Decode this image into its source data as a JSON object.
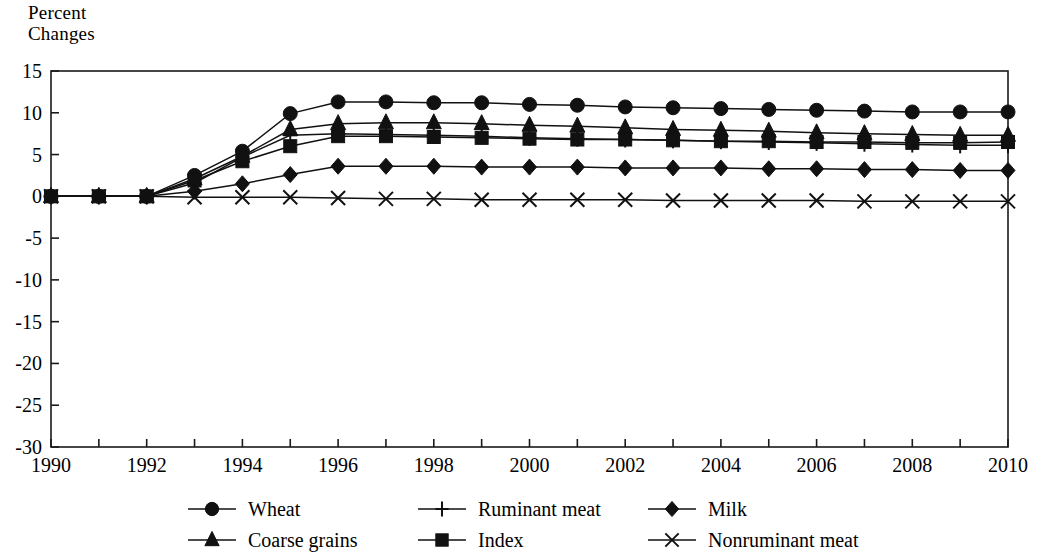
{
  "chart_data": {
    "type": "line",
    "title": "",
    "ylabel": "Percent\nChanges",
    "xlabel": "",
    "xlim": [
      1990,
      2010
    ],
    "ylim": [
      -30,
      15
    ],
    "yticks": [
      15,
      10,
      5,
      0,
      -5,
      -10,
      -15,
      -20,
      -25,
      -30
    ],
    "ytick_labels": [
      "15",
      "10",
      "5",
      "0",
      "-5",
      "-10",
      "-15",
      "-20",
      "-25",
      "-30"
    ],
    "xticks": [
      1990,
      1991,
      1992,
      1993,
      1994,
      1995,
      1996,
      1997,
      1998,
      1999,
      2000,
      2001,
      2002,
      2003,
      2004,
      2005,
      2006,
      2007,
      2008,
      2009,
      2010
    ],
    "xtick_labels": [
      "1990",
      "",
      "1992",
      "",
      "1994",
      "",
      "1996",
      "",
      "1998",
      "",
      "2000",
      "",
      "2002",
      "",
      "2004",
      "",
      "2006",
      "",
      "2008",
      "",
      "2010"
    ],
    "x": [
      1990,
      1991,
      1992,
      1993,
      1994,
      1995,
      1996,
      1997,
      1998,
      1999,
      2000,
      2001,
      2002,
      2003,
      2004,
      2005,
      2006,
      2007,
      2008,
      2009,
      2010
    ],
    "grid": false,
    "legend_position": "bottom",
    "series": [
      {
        "name": "Wheat",
        "marker": "circle",
        "values": [
          0,
          0,
          0,
          2.5,
          5.4,
          9.9,
          11.3,
          11.3,
          11.2,
          11.2,
          11.0,
          10.9,
          10.7,
          10.6,
          10.5,
          10.4,
          10.3,
          10.2,
          10.1,
          10.1,
          10.1
        ]
      },
      {
        "name": "Ruminant meat",
        "marker": "plus",
        "values": [
          0,
          0,
          0,
          1.6,
          4.7,
          7.3,
          7.5,
          7.4,
          7.3,
          7.2,
          7.0,
          6.9,
          6.8,
          6.7,
          6.6,
          6.5,
          6.4,
          6.3,
          6.2,
          6.1,
          6.1
        ]
      },
      {
        "name": "Milk",
        "marker": "diamond",
        "values": [
          0,
          0,
          0,
          0.6,
          1.5,
          2.6,
          3.6,
          3.6,
          3.6,
          3.5,
          3.5,
          3.5,
          3.4,
          3.4,
          3.4,
          3.3,
          3.3,
          3.2,
          3.2,
          3.1,
          3.1
        ]
      },
      {
        "name": "Coarse grains",
        "marker": "triangle",
        "values": [
          0,
          0,
          0,
          2.1,
          4.8,
          8.0,
          8.7,
          8.8,
          8.8,
          8.7,
          8.5,
          8.4,
          8.2,
          8.0,
          7.9,
          7.8,
          7.6,
          7.5,
          7.4,
          7.3,
          7.3
        ]
      },
      {
        "name": "Index",
        "marker": "square",
        "values": [
          0,
          0,
          0,
          1.9,
          4.2,
          6.0,
          7.2,
          7.2,
          7.1,
          7.0,
          6.9,
          6.8,
          6.8,
          6.7,
          6.6,
          6.6,
          6.5,
          6.5,
          6.4,
          6.4,
          6.5
        ]
      },
      {
        "name": "Nonruminant meat",
        "marker": "x",
        "values": [
          0,
          0,
          0,
          -0.1,
          -0.1,
          -0.1,
          -0.2,
          -0.3,
          -0.3,
          -0.4,
          -0.4,
          -0.4,
          -0.4,
          -0.5,
          -0.5,
          -0.5,
          -0.5,
          -0.6,
          -0.6,
          -0.6,
          -0.6
        ]
      }
    ]
  },
  "legend": {
    "entries": [
      {
        "label": "Wheat",
        "marker": "circle"
      },
      {
        "label": "Ruminant meat",
        "marker": "plus"
      },
      {
        "label": "Milk",
        "marker": "diamond"
      },
      {
        "label": "Coarse grains",
        "marker": "triangle"
      },
      {
        "label": "Index",
        "marker": "square"
      },
      {
        "label": "Nonruminant meat",
        "marker": "x"
      }
    ]
  }
}
